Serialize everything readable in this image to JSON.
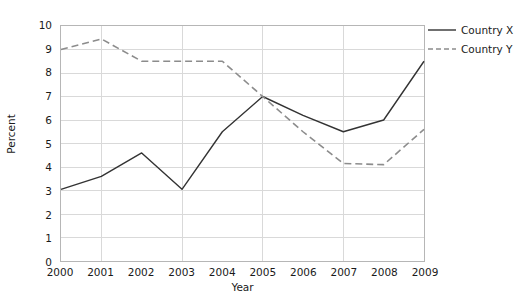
{
  "chart_data": {
    "type": "line",
    "title": "",
    "xlabel": "Year",
    "ylabel": "Percent",
    "categories": [
      "2000",
      "2001",
      "2002",
      "2003",
      "2004",
      "2005",
      "2006",
      "2007",
      "2008",
      "2009"
    ],
    "x": [
      2000,
      2001,
      2002,
      2003,
      2004,
      2005,
      2006,
      2007,
      2008,
      2009
    ],
    "series": [
      {
        "name": "Country X",
        "style": "solid",
        "color": "#333333",
        "values": [
          3.05,
          3.6,
          4.6,
          3.05,
          5.5,
          7.0,
          6.2,
          5.5,
          6.0,
          8.5
        ]
      },
      {
        "name": "Country Y",
        "style": "dashed",
        "color": "#8c8c8c",
        "values": [
          9.0,
          9.45,
          8.5,
          8.5,
          8.5,
          7.0,
          5.5,
          4.15,
          4.1,
          5.6
        ]
      }
    ],
    "ylim": [
      0,
      10
    ],
    "xlim": [
      2000,
      2009
    ],
    "yticks": [
      "0",
      "1",
      "2",
      "3",
      "4",
      "5",
      "6",
      "7",
      "8",
      "9",
      "10"
    ],
    "ytick_values": [
      0,
      1,
      2,
      3,
      4,
      5,
      6,
      7,
      8,
      9,
      10
    ],
    "xticks": [
      "2000",
      "2001",
      "2002",
      "2003",
      "2004",
      "2005",
      "2006",
      "2007",
      "2008",
      "2009"
    ],
    "grid": true,
    "grid_color": "#d9d9d9",
    "grid_horizontal": true,
    "grid_vertical_at": [
      2001,
      2003,
      2005,
      2007,
      2009
    ],
    "legend_position": "top-right",
    "plot_border_color": "#b6b6b6",
    "background_color": "#ffffff"
  }
}
